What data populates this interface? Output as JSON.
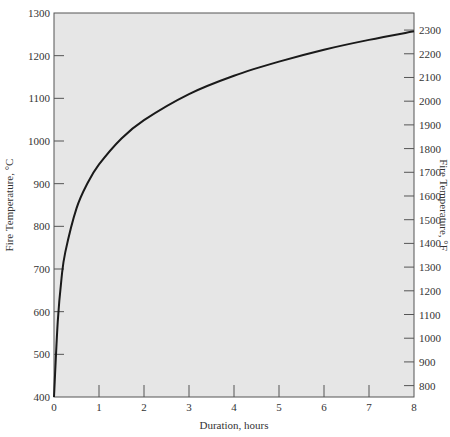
{
  "chart_data": {
    "type": "line",
    "title": "",
    "xlabel": "Duration, hours",
    "ylabel": "Fire Temperature, °C",
    "ylabel_right": "Fire Temperature, °F",
    "xlim": [
      0,
      8
    ],
    "ylim": [
      400,
      1300
    ],
    "ylim_right_f": [
      752,
      2372
    ],
    "grid": false,
    "legend": "none",
    "x_ticks": [
      "0",
      "1",
      "2",
      "3",
      "4",
      "5",
      "6",
      "7",
      "8"
    ],
    "y_ticks": [
      "400",
      "500",
      "600",
      "700",
      "800",
      "900",
      "1000",
      "1100",
      "1200",
      "1300"
    ],
    "y_ticks_right": [
      "800",
      "900",
      "1000",
      "1100",
      "1200",
      "1300",
      "1400",
      "1500",
      "1600",
      "1700",
      "1800",
      "1900",
      "2000",
      "2100",
      "2200",
      "2300"
    ],
    "series": [
      {
        "name": "Standard fire curve",
        "x": [
          0,
          0.083,
          0.167,
          0.25,
          0.5,
          0.75,
          1,
          1.5,
          2,
          3,
          4,
          5,
          6,
          7,
          8
        ],
        "y": [
          400,
          576,
          678,
          739,
          842,
          902,
          945,
          1006,
          1049,
          1110,
          1153,
          1186,
          1214,
          1237,
          1257
        ]
      }
    ]
  }
}
